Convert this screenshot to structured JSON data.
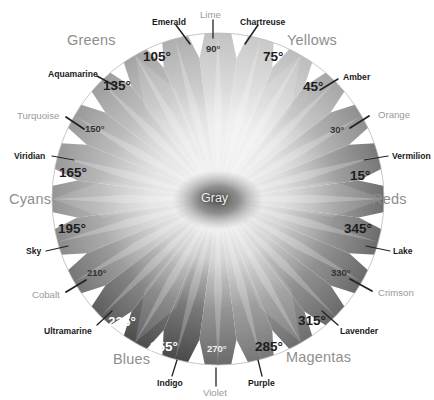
{
  "figure": {
    "background": "#ffffff",
    "center_label": "Gray",
    "center": {
      "x": 218,
      "y": 199
    },
    "radius": 166
  },
  "chart_data": {
    "type": "pie",
    "xlabel": "",
    "ylabel": "",
    "categories": [
      "15°",
      "30°",
      "45°",
      "75°",
      "90°",
      "105°",
      "135°",
      "150°",
      "165°",
      "195°",
      "210°",
      "225°",
      "255°",
      "270°",
      "285°",
      "315°",
      "330°",
      "345°"
    ],
    "values": [
      15,
      30,
      45,
      75,
      90,
      105,
      135,
      150,
      165,
      195,
      210,
      225,
      255,
      270,
      285,
      315,
      330,
      345
    ],
    "legend_position": "around-rim",
    "grid": false,
    "note": "Grayscale hue wheel: 24 radial wedges, major hue names at 15-degree steps, six color-family group names around the outside."
  },
  "families": [
    {
      "id": "greens",
      "label": "Greens",
      "x": 67,
      "y": 33,
      "anchor": "left"
    },
    {
      "id": "yellows",
      "label": "Yellows",
      "x": 287,
      "y": 33,
      "anchor": "left"
    },
    {
      "id": "cyans",
      "label": "Cyans",
      "x": 9,
      "y": 192,
      "anchor": "left"
    },
    {
      "id": "reds",
      "label": "Reds",
      "x": 372,
      "y": 192,
      "anchor": "left"
    },
    {
      "id": "blues",
      "label": "Blues",
      "x": 113,
      "y": 352,
      "anchor": "left"
    },
    {
      "id": "magentas",
      "label": "Magentas",
      "x": 286,
      "y": 350,
      "anchor": "left"
    }
  ],
  "degrees": [
    {
      "id": "d90",
      "label": "90°",
      "x": 206,
      "y": 44,
      "style": "small"
    },
    {
      "id": "d75",
      "label": "75°",
      "x": 263,
      "y": 50,
      "style": "big"
    },
    {
      "id": "d105",
      "label": "105°",
      "x": 143,
      "y": 50,
      "style": "big"
    },
    {
      "id": "d135",
      "label": "135°",
      "x": 103,
      "y": 79,
      "style": "big"
    },
    {
      "id": "d45",
      "label": "45°",
      "x": 303,
      "y": 80,
      "style": "big"
    },
    {
      "id": "d150",
      "label": "150°",
      "x": 85,
      "y": 124,
      "style": "small"
    },
    {
      "id": "d30",
      "label": "30°",
      "x": 330,
      "y": 125,
      "style": "small"
    },
    {
      "id": "d165",
      "label": "165°",
      "x": 59,
      "y": 166,
      "style": "big"
    },
    {
      "id": "d15",
      "label": "15°",
      "x": 350,
      "y": 169,
      "style": "big"
    },
    {
      "id": "d195",
      "label": "195°",
      "x": 58,
      "y": 222,
      "style": "big"
    },
    {
      "id": "d345",
      "label": "345°",
      "x": 344,
      "y": 222,
      "style": "big"
    },
    {
      "id": "d210",
      "label": "210°",
      "x": 87,
      "y": 268,
      "style": "small"
    },
    {
      "id": "d330",
      "label": "330°",
      "x": 331,
      "y": 268,
      "style": "small"
    },
    {
      "id": "d225",
      "label": "225°",
      "x": 108,
      "y": 315,
      "style": "white"
    },
    {
      "id": "d315",
      "label": "315°",
      "x": 298,
      "y": 314,
      "style": "big"
    },
    {
      "id": "d255",
      "label": "255°",
      "x": 150,
      "y": 340,
      "style": "white"
    },
    {
      "id": "d285",
      "label": "285°",
      "x": 255,
      "y": 340,
      "style": "big"
    },
    {
      "id": "d270",
      "label": "270°",
      "x": 207,
      "y": 344,
      "style": "whitesmall"
    }
  ],
  "hue_names": [
    {
      "id": "emerald",
      "label": "Emerald",
      "x": 152,
      "y": 18,
      "tone": "dark"
    },
    {
      "id": "lime",
      "label": "Lime",
      "x": 200,
      "y": 10,
      "tone": "soft"
    },
    {
      "id": "chartreuse",
      "label": "Chartreuse",
      "x": 240,
      "y": 18,
      "tone": "dark"
    },
    {
      "id": "aquamarine",
      "label": "Aquamarine",
      "x": 48,
      "y": 70,
      "tone": "dark"
    },
    {
      "id": "amber",
      "label": "Amber",
      "x": 343,
      "y": 73,
      "tone": "dark"
    },
    {
      "id": "turquoise",
      "label": "Turquoise",
      "x": 17,
      "y": 111,
      "tone": "soft"
    },
    {
      "id": "orange",
      "label": "Orange",
      "x": 378,
      "y": 110,
      "tone": "soft"
    },
    {
      "id": "viridian",
      "label": "Viridian",
      "x": 14,
      "y": 152,
      "tone": "dark"
    },
    {
      "id": "vermilion",
      "label": "Vermilion",
      "x": 392,
      "y": 152,
      "tone": "dark"
    },
    {
      "id": "sky",
      "label": "Sky",
      "x": 26,
      "y": 247,
      "tone": "dark"
    },
    {
      "id": "lake",
      "label": "Lake",
      "x": 393,
      "y": 247,
      "tone": "dark"
    },
    {
      "id": "cobalt",
      "label": "Cobalt",
      "x": 32,
      "y": 290,
      "tone": "soft"
    },
    {
      "id": "crimson",
      "label": "Crimson",
      "x": 378,
      "y": 288,
      "tone": "soft"
    },
    {
      "id": "ultramarine",
      "label": "Ultramarine",
      "x": 44,
      "y": 327,
      "tone": "dark"
    },
    {
      "id": "lavender",
      "label": "Lavender",
      "x": 340,
      "y": 327,
      "tone": "dark"
    },
    {
      "id": "indigo",
      "label": "Indigo",
      "x": 157,
      "y": 379,
      "tone": "dark"
    },
    {
      "id": "violet",
      "label": "Violet",
      "x": 203,
      "y": 388,
      "tone": "soft"
    },
    {
      "id": "purple",
      "label": "Purple",
      "x": 248,
      "y": 379,
      "tone": "dark"
    }
  ],
  "leaders": [
    {
      "id": "leader-lime",
      "x1": 213,
      "y1": 20,
      "x2": 213,
      "y2": 38,
      "weight": 1.3
    },
    {
      "id": "leader-emerald",
      "x1": 176,
      "y1": 25,
      "x2": 190,
      "y2": 44,
      "weight": 1.5
    },
    {
      "id": "leader-chartreuse",
      "x1": 258,
      "y1": 25,
      "x2": 245,
      "y2": 44,
      "weight": 1.5
    },
    {
      "id": "leader-aquamarine",
      "x1": 97,
      "y1": 76,
      "x2": 117,
      "y2": 87,
      "weight": 1.5
    },
    {
      "id": "leader-amber",
      "x1": 338,
      "y1": 79,
      "x2": 320,
      "y2": 90,
      "weight": 1.5
    },
    {
      "id": "leader-turquoise",
      "x1": 66,
      "y1": 117,
      "x2": 84,
      "y2": 129,
      "weight": 1.8
    },
    {
      "id": "leader-orange",
      "x1": 369,
      "y1": 116,
      "x2": 350,
      "y2": 128,
      "weight": 1.8
    },
    {
      "id": "leader-viridian",
      "x1": 52,
      "y1": 156,
      "x2": 74,
      "y2": 160,
      "weight": 1.2
    },
    {
      "id": "leader-vermilion",
      "x1": 388,
      "y1": 156,
      "x2": 364,
      "y2": 160,
      "weight": 1.2
    },
    {
      "id": "leader-sky",
      "x1": 46,
      "y1": 251,
      "x2": 68,
      "y2": 246,
      "weight": 1.2
    },
    {
      "id": "leader-lake",
      "x1": 390,
      "y1": 251,
      "x2": 366,
      "y2": 246,
      "weight": 1.2
    },
    {
      "id": "leader-cobalt",
      "x1": 66,
      "y1": 292,
      "x2": 86,
      "y2": 280,
      "weight": 1.8
    },
    {
      "id": "leader-crimson",
      "x1": 372,
      "y1": 291,
      "x2": 350,
      "y2": 279,
      "weight": 1.8
    },
    {
      "id": "leader-ultramarine",
      "x1": 97,
      "y1": 325,
      "x2": 112,
      "y2": 311,
      "weight": 1.3
    },
    {
      "id": "leader-lavender",
      "x1": 338,
      "y1": 325,
      "x2": 322,
      "y2": 311,
      "weight": 1.3
    },
    {
      "id": "leader-indigo",
      "x1": 172,
      "y1": 376,
      "x2": 177,
      "y2": 360,
      "weight": 1.3
    },
    {
      "id": "leader-violet",
      "x1": 216,
      "y1": 386,
      "x2": 216,
      "y2": 368,
      "weight": 1.3
    },
    {
      "id": "leader-purple",
      "x1": 262,
      "y1": 376,
      "x2": 258,
      "y2": 360,
      "weight": 1.3
    }
  ],
  "wedges": [
    {
      "angle": 0,
      "rim": "#6f6f6f",
      "mid": "#bdbdbd"
    },
    {
      "angle": 15,
      "rim": "#787878",
      "mid": "#c3c3c3"
    },
    {
      "angle": 30,
      "rim": "#8f8f8f",
      "mid": "#cfcfcf"
    },
    {
      "angle": 45,
      "rim": "#a6a6a6",
      "mid": "#dcdcdc"
    },
    {
      "angle": 60,
      "rim": "#bdbdbd",
      "mid": "#e6e6e6"
    },
    {
      "angle": 75,
      "rim": "#c9c9c9",
      "mid": "#ececec"
    },
    {
      "angle": 90,
      "rim": "#c2c2c2",
      "mid": "#e8e8e8"
    },
    {
      "angle": 105,
      "rim": "#aeaeae",
      "mid": "#dedede"
    },
    {
      "angle": 120,
      "rim": "#a3a3a3",
      "mid": "#d7d7d7"
    },
    {
      "angle": 135,
      "rim": "#9e9e9e",
      "mid": "#d4d4d4"
    },
    {
      "angle": 150,
      "rim": "#9a9a9a",
      "mid": "#d2d2d2"
    },
    {
      "angle": 165,
      "rim": "#9a9a9a",
      "mid": "#d1d1d1"
    },
    {
      "angle": 180,
      "rim": "#949494",
      "mid": "#cdcdcd"
    },
    {
      "angle": 195,
      "rim": "#8a8a8a",
      "mid": "#c6c6c6"
    },
    {
      "angle": 210,
      "rim": "#767676",
      "mid": "#b7b7b7"
    },
    {
      "angle": 225,
      "rim": "#5d5d5d",
      "mid": "#a3a3a3"
    },
    {
      "angle": 240,
      "rim": "#4d4d4d",
      "mid": "#959595"
    },
    {
      "angle": 255,
      "rim": "#4a4a4a",
      "mid": "#939393"
    },
    {
      "angle": 270,
      "rim": "#6a6a6a",
      "mid": "#ababab"
    },
    {
      "angle": 285,
      "rim": "#777777",
      "mid": "#b5b5b5"
    },
    {
      "angle": 300,
      "rim": "#6e6e6e",
      "mid": "#aeaeae"
    },
    {
      "angle": 315,
      "rim": "#6a6a6a",
      "mid": "#ababab"
    },
    {
      "angle": 330,
      "rim": "#6a6a6a",
      "mid": "#adadad"
    },
    {
      "angle": 345,
      "rim": "#6c6c6c",
      "mid": "#b4b4b4"
    }
  ],
  "colors": {
    "background": "#ffffff",
    "family_text": "#8e8e8e",
    "degree_text": "#1d1d1d",
    "degree_text_light": "#ffffff",
    "name_text": "#1a1a1a",
    "name_text_soft": "#9a9a9a",
    "leader_line": "#222222",
    "center_core": "#4a4a4a"
  }
}
